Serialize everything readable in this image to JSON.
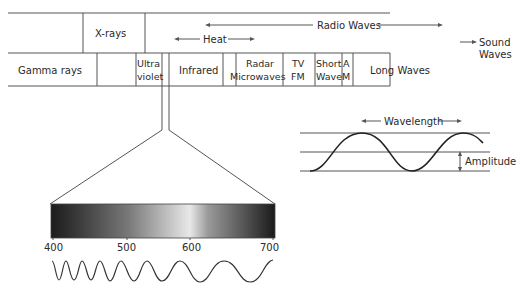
{
  "spectrum_bands": {
    "top_row": {
      "xrays": "X-rays",
      "heat": "Heat",
      "radio_waves": "Radio Waves"
    },
    "bottom_row": {
      "gamma": "Gamma rays",
      "ultraviolet_1": "Ultra",
      "ultraviolet_2": "violet",
      "infrared": "Infrared",
      "radar_1": "Radar",
      "radar_2": "Microwaves",
      "tv_1": "TV",
      "tv_2": "FM",
      "short_1": "Short",
      "short_2": "Wave",
      "am_1": "A",
      "am_2": "M",
      "long": "Long Waves"
    },
    "sound_1": "Sound",
    "sound_2": "Waves"
  },
  "wave_diagram": {
    "wavelength": "Wavelength",
    "amplitude": "Amplitude"
  },
  "visible_scale": {
    "ticks": [
      "400",
      "500",
      "600",
      "700"
    ],
    "unit_hint": "nm"
  }
}
